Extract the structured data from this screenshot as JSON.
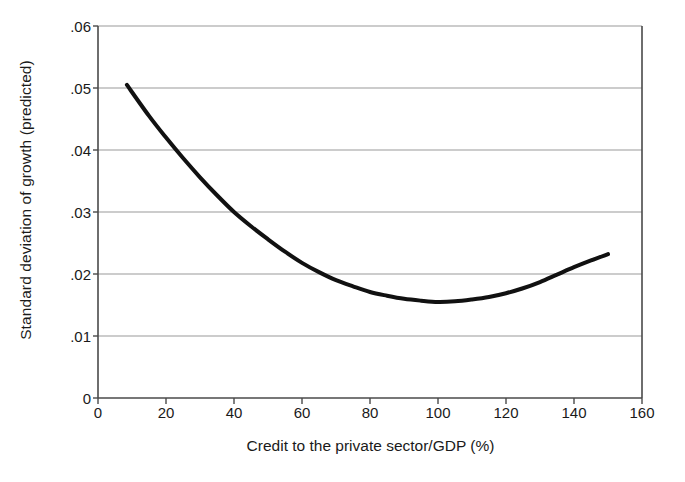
{
  "chart_data": {
    "type": "line",
    "title": "",
    "xlabel": "Credit to the private sector/GDP (%)",
    "ylabel": "Standard deviation of growth (predicted)",
    "xlim": [
      0,
      160
    ],
    "ylim": [
      0,
      0.06
    ],
    "xticks": [
      0,
      20,
      40,
      60,
      80,
      100,
      120,
      140,
      160
    ],
    "xticklabels": [
      "0",
      "20",
      "40",
      "60",
      "80",
      "100",
      "120",
      "140",
      "160"
    ],
    "yticks": [
      0,
      0.01,
      0.02,
      0.03,
      0.04,
      0.05,
      0.06
    ],
    "yticklabels": [
      "0",
      ".01",
      ".02",
      ".03",
      ".04",
      ".05",
      ".06"
    ],
    "grid": "horizontal",
    "legend": "none",
    "line_color": "#111111",
    "line_width": 4,
    "series": [
      {
        "name": "Predicted standard deviation of growth",
        "x": [
          8.5,
          15,
          20,
          25,
          30,
          35,
          40,
          45,
          50,
          55,
          60,
          65,
          70,
          75,
          80,
          85,
          90,
          95,
          100,
          105,
          110,
          115,
          120,
          125,
          130,
          135,
          140,
          145,
          150
        ],
        "y": [
          0.0505,
          0.0455,
          0.042,
          0.0387,
          0.0356,
          0.0327,
          0.03,
          0.0277,
          0.0256,
          0.0236,
          0.0218,
          0.0203,
          0.019,
          0.018,
          0.0171,
          0.0165,
          0.016,
          0.0157,
          0.0155,
          0.0156,
          0.0159,
          0.0163,
          0.0169,
          0.0177,
          0.0187,
          0.0199,
          0.0211,
          0.0222,
          0.0232
        ]
      }
    ]
  },
  "axes": {
    "frame_color": "#4a4a4a",
    "grid_color": "#9a9a9a"
  }
}
